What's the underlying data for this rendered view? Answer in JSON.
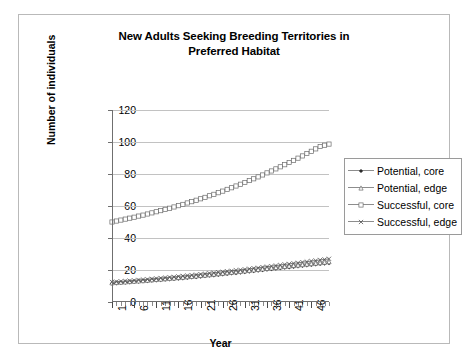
{
  "chart_data": {
    "type": "line",
    "title": "New Adults Seeking Breeding Territories in Preferred Habitat",
    "title_line1": "New Adults Seeking Breeding Territories in",
    "title_line2": "Preferred Habitat",
    "xlabel": "Year",
    "ylabel": "Number of individuals",
    "xlim": [
      1,
      50
    ],
    "ylim": [
      0,
      120
    ],
    "ytick_labels": [
      "0",
      "20",
      "40",
      "60",
      "80",
      "100",
      "120"
    ],
    "ytick_values": [
      0,
      20,
      40,
      60,
      80,
      100,
      120
    ],
    "xtick_labels": [
      "1",
      "6",
      "11",
      "16",
      "21",
      "26",
      "31",
      "36",
      "41",
      "46"
    ],
    "xtick_values": [
      1,
      6,
      11,
      16,
      21,
      26,
      31,
      36,
      41,
      46
    ],
    "grid": true,
    "grid_axis": "y",
    "legend_position": "right",
    "x": [
      1,
      2,
      3,
      4,
      5,
      6,
      7,
      8,
      9,
      10,
      11,
      12,
      13,
      14,
      15,
      16,
      17,
      18,
      19,
      20,
      21,
      22,
      23,
      24,
      25,
      26,
      27,
      28,
      29,
      30,
      31,
      32,
      33,
      34,
      35,
      36,
      37,
      38,
      39,
      40,
      41,
      42,
      43,
      44,
      45,
      46,
      47,
      48,
      49,
      50
    ],
    "series": [
      {
        "name": "Potential, core",
        "marker": "filled-diamond",
        "color": "#2b2b2b",
        "values": [
          11.5,
          11.7,
          11.9,
          12.1,
          12.3,
          12.5,
          12.7,
          12.9,
          13.1,
          13.3,
          13.5,
          13.7,
          13.9,
          14.1,
          14.4,
          14.6,
          14.8,
          15.1,
          15.3,
          15.6,
          15.8,
          16.1,
          16.4,
          16.6,
          16.9,
          17.2,
          17.5,
          17.8,
          18.1,
          18.4,
          18.7,
          19.0,
          19.3,
          19.6,
          19.9,
          20.2,
          20.5,
          20.8,
          21.1,
          21.4,
          21.7,
          22.0,
          22.3,
          22.6,
          22.9,
          23.2,
          23.5,
          23.8,
          24.0,
          24.3
        ]
      },
      {
        "name": "Potential, edge",
        "marker": "open-triangle",
        "color": "#6b6b6b",
        "values": [
          12.0,
          12.2,
          12.4,
          12.6,
          12.8,
          13.0,
          13.2,
          13.4,
          13.6,
          13.9,
          14.1,
          14.3,
          14.6,
          14.8,
          15.0,
          15.3,
          15.5,
          15.8,
          16.0,
          16.3,
          16.6,
          16.8,
          17.1,
          17.4,
          17.7,
          18.0,
          18.3,
          18.6,
          18.9,
          19.2,
          19.5,
          19.8,
          20.1,
          20.4,
          20.7,
          21.0,
          21.3,
          21.6,
          21.9,
          22.2,
          22.5,
          22.8,
          23.1,
          23.4,
          23.7,
          24.0,
          24.3,
          24.6,
          24.9,
          25.2
        ]
      },
      {
        "name": "Successful, core",
        "marker": "open-square",
        "color": "#6b6b6b",
        "values": [
          50.0,
          50.6,
          51.2,
          51.8,
          52.4,
          53.0,
          53.7,
          54.3,
          55.0,
          55.7,
          56.4,
          57.1,
          57.9,
          58.6,
          59.4,
          60.2,
          61.0,
          61.9,
          62.7,
          63.6,
          64.5,
          65.4,
          66.4,
          67.3,
          68.3,
          69.3,
          70.4,
          71.4,
          72.5,
          73.6,
          74.7,
          75.9,
          77.0,
          78.2,
          79.4,
          80.7,
          81.9,
          83.2,
          84.5,
          85.8,
          87.2,
          88.5,
          89.9,
          91.3,
          92.8,
          94.2,
          95.7,
          97.2,
          98.0,
          98.7
        ]
      },
      {
        "name": "Successful, edge",
        "marker": "x-cross",
        "color": "#555555",
        "values": [
          12.5,
          12.7,
          12.9,
          13.1,
          13.3,
          13.5,
          13.8,
          14.0,
          14.2,
          14.5,
          14.7,
          15.0,
          15.2,
          15.5,
          15.7,
          16.0,
          16.3,
          16.5,
          16.8,
          17.1,
          17.4,
          17.7,
          18.0,
          18.3,
          18.6,
          18.9,
          19.2,
          19.5,
          19.8,
          20.1,
          20.4,
          20.8,
          21.1,
          21.4,
          21.8,
          22.1,
          22.4,
          22.8,
          23.1,
          23.5,
          23.8,
          24.2,
          24.5,
          24.9,
          25.2,
          25.6,
          25.9,
          26.3,
          26.6,
          27.0
        ]
      }
    ]
  },
  "legend": {
    "items": [
      {
        "label": "Potential, core"
      },
      {
        "label": "Potential, edge"
      },
      {
        "label": "Successful, core"
      },
      {
        "label": "Successful, edge"
      }
    ]
  }
}
